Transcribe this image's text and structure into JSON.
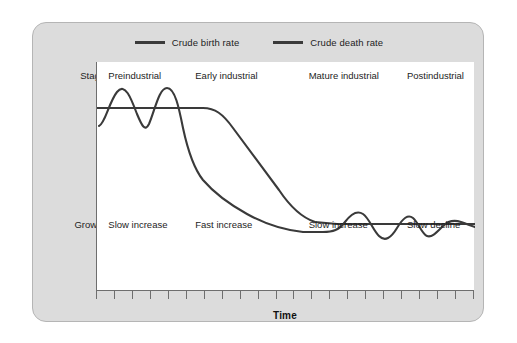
{
  "figure": {
    "panel_color": "#dcdcdc",
    "plot_color": "#ffffff",
    "line_color": "#3a3a3a",
    "axis_color": "#6e6e6e"
  },
  "legend": {
    "position": "top-center",
    "entries": [
      {
        "label": "Crude birth rate",
        "color": "#3a3a3a",
        "icon": "line-swatch"
      },
      {
        "label": "Crude death rate",
        "color": "#3a3a3a",
        "icon": "line-swatch"
      }
    ]
  },
  "rows": {
    "stage_label": "Stage",
    "growth_label": "Growth"
  },
  "stages": [
    {
      "name": "Preindustrial",
      "growth": "Slow increase",
      "x_pct": 3
    },
    {
      "name": "Early industrial",
      "growth": "Fast increase",
      "x_pct": 26
    },
    {
      "name": "Mature industrial",
      "growth": "Slow increase",
      "x_pct": 56
    },
    {
      "name": "Postindustrial",
      "growth": "Slow decline",
      "x_pct": 82
    }
  ],
  "axis": {
    "xlabel": "Time",
    "tick_count": 22,
    "ticks_labeled": false
  },
  "chart_data": {
    "type": "line",
    "xlabel": "Time",
    "ylabel": "",
    "xlim": [
      0,
      100
    ],
    "ylim": [
      0,
      100
    ],
    "grid": false,
    "legend_position": "top-center",
    "annotations": [
      {
        "text": "Stage",
        "role": "row-label"
      },
      {
        "text": "Growth",
        "role": "row-label"
      },
      {
        "text": "Preindustrial",
        "role": "stage",
        "x": 3
      },
      {
        "text": "Early industrial",
        "role": "stage",
        "x": 26
      },
      {
        "text": "Mature industrial",
        "role": "stage",
        "x": 56
      },
      {
        "text": "Postindustrial",
        "role": "stage",
        "x": 82
      },
      {
        "text": "Slow increase",
        "role": "growth",
        "x": 3
      },
      {
        "text": "Fast increase",
        "role": "growth",
        "x": 26
      },
      {
        "text": "Slow increase",
        "role": "growth",
        "x": 56
      },
      {
        "text": "Slow decline",
        "role": "growth",
        "x": 82
      }
    ],
    "series": [
      {
        "name": "Crude birth rate",
        "color": "#3a3a3a",
        "x": [
          0,
          2,
          5,
          8,
          11,
          14,
          17,
          20,
          22,
          24,
          27,
          31,
          36,
          41,
          46,
          51,
          55,
          58,
          61,
          64,
          67,
          70,
          73,
          76,
          79,
          82,
          85,
          88,
          91,
          94,
          97,
          100
        ],
        "y": [
          72,
          78,
          88,
          80,
          72,
          82,
          90,
          82,
          70,
          60,
          52,
          46,
          42,
          38,
          34,
          31,
          29,
          28,
          28,
          28,
          29,
          33,
          38,
          34,
          28,
          33,
          36,
          30,
          33,
          35,
          33,
          34
        ]
      },
      {
        "name": "Crude death rate",
        "color": "#3a3a3a",
        "x": [
          0,
          10,
          20,
          28,
          33,
          38,
          44,
          50,
          56,
          60,
          64,
          68,
          72,
          76,
          82,
          88,
          94,
          100
        ],
        "y": [
          80,
          80,
          80,
          80,
          79,
          74,
          66,
          57,
          48,
          42,
          37,
          35,
          35,
          35,
          35,
          35,
          35,
          35
        ]
      }
    ]
  }
}
